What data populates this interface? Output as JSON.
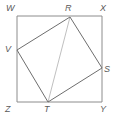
{
  "figure": {
    "kind": "geometry-diagram",
    "width": 116,
    "height": 117,
    "background_color": "#ffffff"
  },
  "style": {
    "square_stroke_color": "#8c8c8c",
    "quad_stroke_color": "#6e6e6e",
    "diagonal_stroke_color": "#c0c0c0",
    "label_color": "#5a5a5a",
    "square_stroke_width": 1,
    "quad_stroke_width": 1,
    "diagonal_stroke_width": 1,
    "label_font_size": 9
  },
  "outer_square": {
    "name": "WXYZ",
    "vertices": [
      {
        "id": "W",
        "label": "W",
        "x": 17,
        "y": 16,
        "label_x": 6,
        "label_y": 4
      },
      {
        "id": "X",
        "label": "X",
        "x": 102,
        "y": 16,
        "label_x": 100,
        "label_y": 4
      },
      {
        "id": "Y",
        "label": "Y",
        "x": 102,
        "y": 102,
        "label_x": 100,
        "label_y": 105
      },
      {
        "id": "Z",
        "label": "Z",
        "x": 17,
        "y": 102,
        "label_x": 5,
        "label_y": 105
      }
    ],
    "path": "17,16 102,16 102,102 17,102"
  },
  "inner_quad": {
    "name": "RSTV",
    "vertices": [
      {
        "id": "R",
        "label": "R",
        "x": 70,
        "y": 17,
        "on_edge": "WX",
        "label_x": 65,
        "label_y": 4
      },
      {
        "id": "S",
        "label": "S",
        "x": 102,
        "y": 68,
        "on_edge": "XY",
        "label_x": 104,
        "label_y": 65
      },
      {
        "id": "T",
        "label": "T",
        "x": 48,
        "y": 102,
        "on_edge": "ZY",
        "label_x": 44,
        "label_y": 105
      },
      {
        "id": "V",
        "label": "V",
        "x": 17,
        "y": 50,
        "on_edge": "WZ",
        "label_x": 5,
        "label_y": 45
      }
    ],
    "path": "70,17 102,68 48,102 17,50"
  },
  "diagonal": {
    "id": "RT",
    "from": "R",
    "to": "T",
    "x1": 70,
    "y1": 17,
    "x2": 48,
    "y2": 102
  }
}
